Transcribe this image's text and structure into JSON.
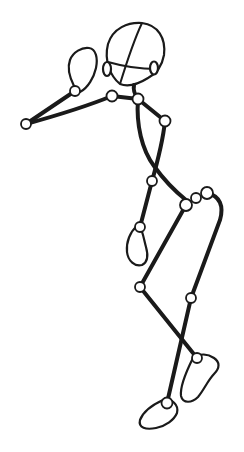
{
  "figure": {
    "stroke_color": "#1a1a1a",
    "background": "#ffffff",
    "joints": [
      {
        "name": "left-elbow",
        "x": 26,
        "y": 124,
        "r": 5
      },
      {
        "name": "left-wrist",
        "x": 75,
        "y": 91,
        "r": 5
      },
      {
        "name": "left-shoulder",
        "x": 112,
        "y": 96,
        "r": 5.5
      },
      {
        "name": "neck-shoulder",
        "x": 138,
        "y": 99,
        "r": 5.5
      },
      {
        "name": "right-elbow",
        "x": 165,
        "y": 121,
        "r": 5.5
      },
      {
        "name": "right-wrist",
        "x": 152,
        "y": 181,
        "r": 5
      },
      {
        "name": "right-hand",
        "x": 140,
        "y": 227,
        "r": 5
      },
      {
        "name": "hip-left",
        "x": 186,
        "y": 205,
        "r": 6
      },
      {
        "name": "hip-center",
        "x": 196,
        "y": 198,
        "r": 5
      },
      {
        "name": "hip-right",
        "x": 207,
        "y": 193,
        "r": 6
      },
      {
        "name": "left-knee",
        "x": 140,
        "y": 287,
        "r": 5
      },
      {
        "name": "right-knee",
        "x": 191,
        "y": 298,
        "r": 5
      },
      {
        "name": "right-ankle",
        "x": 197,
        "y": 358,
        "r": 5
      },
      {
        "name": "left-ankle",
        "x": 167,
        "y": 403,
        "r": 5.5
      }
    ]
  }
}
